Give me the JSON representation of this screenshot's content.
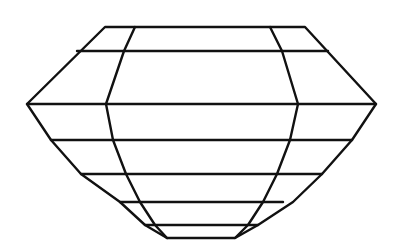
{
  "diagram": {
    "colors": {
      "background": "#ffffff",
      "line": "#111111"
    },
    "outline": [
      [
        105,
        27
      ],
      [
        305,
        27
      ],
      [
        376,
        104
      ],
      [
        352,
        140
      ],
      [
        322,
        174
      ],
      [
        293,
        202
      ],
      [
        258,
        225
      ],
      [
        235,
        238
      ],
      [
        167,
        238
      ],
      [
        145,
        225
      ],
      [
        120,
        202
      ],
      [
        81,
        174
      ],
      [
        51,
        140
      ],
      [
        27,
        104
      ]
    ],
    "horizontal_lines": [
      [
        [
          77,
          51
        ],
        [
          328,
          51
        ]
      ],
      [
        [
          27,
          104
        ],
        [
          376,
          104
        ]
      ],
      [
        [
          51,
          140
        ],
        [
          352,
          140
        ]
      ],
      [
        [
          81,
          174
        ],
        [
          322,
          174
        ]
      ],
      [
        [
          120,
          202
        ],
        [
          283,
          202
        ]
      ],
      [
        [
          145,
          225
        ],
        [
          258,
          225
        ]
      ]
    ],
    "inner_left": [
      [
        135,
        27
      ],
      [
        124,
        51
      ],
      [
        106,
        104
      ],
      [
        113,
        140
      ],
      [
        126,
        174
      ],
      [
        140,
        202
      ],
      [
        155,
        225
      ],
      [
        167,
        238
      ]
    ],
    "inner_right": [
      [
        270,
        27
      ],
      [
        282,
        51
      ],
      [
        298,
        104
      ],
      [
        290,
        140
      ],
      [
        277,
        174
      ],
      [
        263,
        202
      ],
      [
        248,
        225
      ],
      [
        235,
        238
      ]
    ]
  }
}
